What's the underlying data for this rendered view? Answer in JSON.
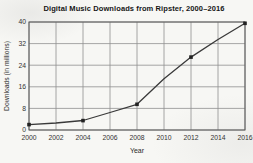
{
  "chart_data": {
    "type": "line",
    "title": "Digital Music Downloads from Ripster, 2000–2016",
    "xlabel": "Year",
    "ylabel": "Downloads (in millions)",
    "x_ticks": [
      2000,
      2002,
      2004,
      2006,
      2008,
      2010,
      2012,
      2014,
      2016
    ],
    "y_ticks": [
      0,
      8,
      16,
      24,
      32,
      40
    ],
    "xlim": [
      2000,
      2016
    ],
    "ylim": [
      0,
      40
    ],
    "grid": true,
    "legend": "none",
    "marker": "square",
    "colors": {
      "line": "#3a3a3a",
      "marker": "#222222",
      "grid": "#909090",
      "frame": "#5a5a5a",
      "text": "#333333"
    },
    "points": [
      {
        "x": 2000,
        "y": 2
      },
      {
        "x": 2004,
        "y": 3.5
      },
      {
        "x": 2008,
        "y": 9.5
      },
      {
        "x": 2012,
        "y": 27
      },
      {
        "x": 2016,
        "y": 39.5
      }
    ],
    "line_path": [
      [
        2000,
        2
      ],
      [
        2002,
        2.6
      ],
      [
        2004,
        3.5
      ],
      [
        2006,
        6.5
      ],
      [
        2008,
        9.5
      ],
      [
        2010,
        19
      ],
      [
        2012,
        27
      ],
      [
        2014,
        33.5
      ],
      [
        2016,
        39.5
      ]
    ]
  }
}
